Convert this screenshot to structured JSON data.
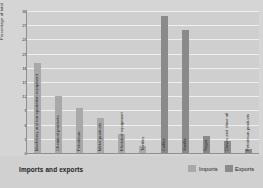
{
  "chart_data": {
    "type": "bar",
    "title": "Imports and exports",
    "xlabel": "",
    "ylabel": "Percentage of total",
    "ylim": [
      0,
      30
    ],
    "yticks": [
      0,
      3,
      6,
      9,
      12,
      15,
      18,
      21,
      24,
      27,
      30
    ],
    "grid": true,
    "legend_position": "bottom-right",
    "legend": [
      "Imports",
      "Exports"
    ],
    "categories": [
      "Machinery and transportation equipment",
      "Chemical products",
      "Petroleum",
      "Metal products",
      "Electrical equipment",
      "Textiles",
      "Coffee",
      "Vanilla",
      "Sugar",
      "Cloves and clove oil",
      "Petroleum products"
    ],
    "values": [
      19,
      12,
      9.5,
      7.5,
      4,
      1.5,
      29,
      26,
      3.5,
      2.5,
      0.8
    ],
    "series_of": [
      "Imports",
      "Imports",
      "Imports",
      "Imports",
      "Imports",
      "Imports",
      "Exports",
      "Exports",
      "Exports",
      "Exports",
      "Exports"
    ]
  },
  "colors": {
    "imports": "#a9a9a9",
    "exports": "#8a8a8a",
    "background": "#d5d5d5",
    "plot_background": "#cfcfcf",
    "gridline": "#efefef"
  },
  "footer": {
    "title": "Imports and exports",
    "legend": [
      {
        "label": "Imports"
      },
      {
        "label": "Exports"
      }
    ]
  }
}
